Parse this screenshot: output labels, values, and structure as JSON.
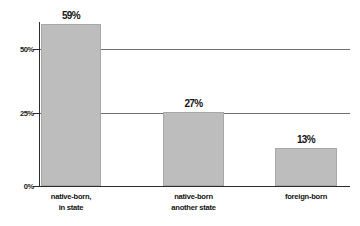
{
  "chart_data": {
    "type": "bar",
    "title": "",
    "subtitle": "",
    "xlabel": "",
    "ylabel": "",
    "categories": [
      "native-born, in state",
      "native-born another state",
      "foreign-born"
    ],
    "category_lines": [
      [
        "native-born,",
        "in state"
      ],
      [
        "native-born",
        "another state"
      ],
      [
        "foreign-born"
      ]
    ],
    "values": [
      59,
      27,
      13
    ],
    "value_labels": [
      "59%",
      "13%",
      "27%"
    ],
    "ylim": [
      0,
      62.5
    ],
    "yticks": [
      0,
      25,
      50
    ],
    "ytick_labels": [
      "0%",
      "25%",
      "50%"
    ],
    "grid": "horizontal",
    "legend": "none",
    "colors": {
      "bar_fill": "#bdbdbd",
      "bar_border": "#a8a8a8",
      "axis": "#2b2b2b",
      "gridline": "#6f6f6f",
      "text": "#141414",
      "background": "#ffffff"
    }
  },
  "axis": {
    "ytick_0": "0%",
    "ytick_25": "25%",
    "ytick_50": "50%"
  },
  "bars": [
    {
      "value_label": "59%",
      "line1": "native-born,",
      "line2": "in state"
    },
    {
      "value_label": "27%",
      "line1": "native-born",
      "line2": "another state"
    },
    {
      "value_label": "13%",
      "line1": "foreign-born",
      "line2": ""
    }
  ]
}
